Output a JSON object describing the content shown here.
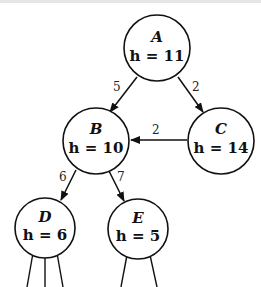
{
  "diagram": {
    "type": "search-graph",
    "nodes": [
      {
        "id": "A",
        "label": "A",
        "h_text": "h = 11",
        "h": 11
      },
      {
        "id": "B",
        "label": "B",
        "h_text": "h = 10",
        "h": 10
      },
      {
        "id": "C",
        "label": "C",
        "h_text": "h = 14",
        "h": 14
      },
      {
        "id": "D",
        "label": "D",
        "h_text": "h = 6",
        "h": 6
      },
      {
        "id": "E",
        "label": "E",
        "h_text": "h = 5",
        "h": 5
      }
    ],
    "edges": [
      {
        "from": "A",
        "to": "B",
        "weight": "5"
      },
      {
        "from": "A",
        "to": "C",
        "weight": "2"
      },
      {
        "from": "C",
        "to": "B",
        "weight": "2"
      },
      {
        "from": "B",
        "to": "D",
        "weight": "6"
      },
      {
        "from": "B",
        "to": "E",
        "weight": "7"
      }
    ],
    "colors": {
      "stroke": "#111111",
      "background": "#ffffff"
    }
  }
}
